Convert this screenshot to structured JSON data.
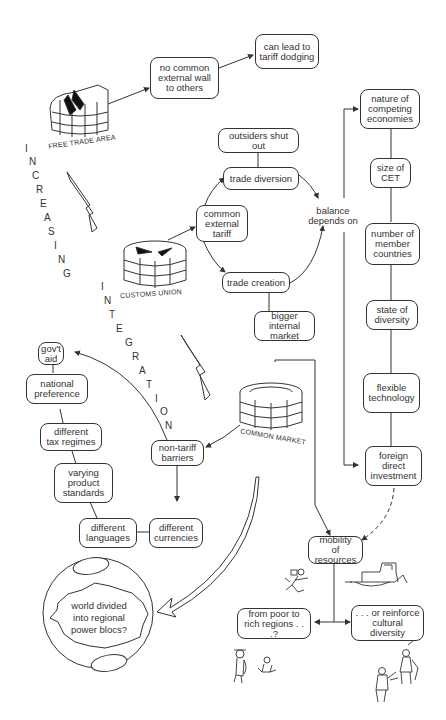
{
  "diagram": {
    "stages": [
      {
        "id": "free_trade_area",
        "label": "FREE TRADE AREA"
      },
      {
        "id": "customs_union",
        "label": "CUSTOMS UNION"
      },
      {
        "id": "common_market",
        "label": "COMMON MARKET"
      }
    ],
    "vertical_label": {
      "word1": [
        "I",
        "N",
        "C",
        "R",
        "E",
        "A",
        "S",
        "I",
        "N",
        "G"
      ],
      "word2": [
        "I",
        "N",
        "T",
        "E",
        "G",
        "R",
        "A",
        "T",
        "I",
        "O",
        "N"
      ]
    },
    "nodes": {
      "no_common_wall": "no common\nexternal wall\nto others",
      "tariff_dodging": "can lead to\ntariff dodging",
      "outsiders_shut_out": "outsiders shut out",
      "trade_diversion": "trade diversion",
      "common_external_tariff": "common\nexternal\ntariff",
      "balance_depends_on": "balance\ndepends on",
      "trade_creation": "trade creation",
      "bigger_internal_market": "bigger internal\nmarket",
      "nature_competing": "nature of\ncompeting\neconomies",
      "size_cet": "size of\nCET",
      "number_members": "number of\nmember\ncountries",
      "state_diversity": "state of\ndiversity",
      "flexible_tech": "flexible\ntechnology",
      "fdi": "foreign\ndirect\ninvestment",
      "govt_aid": "gov't\naid",
      "national_pref": "national\npreference",
      "tax_regimes": "different\ntax regimes",
      "product_standards": "varying\nproduct\nstandards",
      "languages": "different\nlanguages",
      "currencies": "different\ncurrencies",
      "non_tariff": "non-tariff\nbarriers",
      "mobility": "mobility\nof resources",
      "poor_to_rich": "from poor to\nrich regions . . .?",
      "reinforce_cultural": ". . . or reinforce\ncultural\ndiversity",
      "world_divided": "world divided\ninto regional\npower blocs?"
    },
    "colors": {
      "line": "#333333",
      "background": "#ffffff"
    }
  }
}
